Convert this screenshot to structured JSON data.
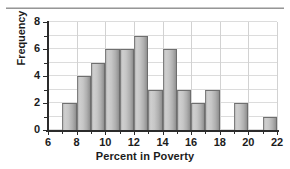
{
  "chart_data": {
    "type": "bar",
    "title": "",
    "xlabel": "Percent in Poverty",
    "ylabel": "Frequency",
    "xlim": [
      6,
      22
    ],
    "ylim": [
      0,
      8
    ],
    "grid": true,
    "legend_position": "none",
    "bin_width": 1,
    "xtick_labels": [
      "6",
      "8",
      "10",
      "12",
      "14",
      "16",
      "18",
      "20",
      "22"
    ],
    "xtick_values": [
      6,
      8,
      10,
      12,
      14,
      16,
      18,
      20,
      22
    ],
    "xtick_minor_values": [
      7,
      9,
      11,
      13,
      15,
      17,
      19,
      21
    ],
    "ytick_labels": [
      "0",
      "2",
      "4",
      "6",
      "8"
    ],
    "ytick_values": [
      0,
      2,
      4,
      6,
      8
    ],
    "ytick_minor_values": [
      1,
      3,
      5,
      7
    ],
    "categories": [
      "7-8",
      "8-9",
      "9-10",
      "10-11",
      "11-12",
      "12-13",
      "13-14",
      "14-15",
      "15-16",
      "16-17",
      "17-18",
      "18-19",
      "19-20",
      "20-21",
      "21-22"
    ],
    "bin_starts": [
      7,
      8,
      9,
      10,
      11,
      12,
      13,
      14,
      15,
      16,
      17,
      18,
      19,
      20,
      21
    ],
    "bin_ends": [
      8,
      9,
      10,
      11,
      12,
      13,
      14,
      15,
      16,
      17,
      18,
      19,
      20,
      21,
      22
    ],
    "values": [
      2,
      4,
      5,
      6,
      6,
      7,
      3,
      6,
      3,
      2,
      3,
      0,
      2,
      0,
      1
    ],
    "total_count": 50,
    "colors": {
      "bar_fill_light": "#cfcfcf",
      "bar_fill_dark": "#8e8e8e",
      "bar_edge": "#6f6f6f",
      "gridline": "#dcdcdc",
      "axis": "#2b2b2b",
      "text": "#1c1c1c",
      "background": "#ffffff"
    }
  }
}
